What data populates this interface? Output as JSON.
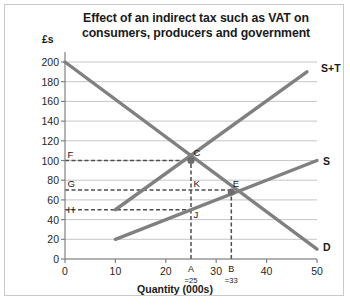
{
  "chart_data": {
    "type": "line",
    "title": "Effect of an indirect tax such as VAT on consumers, producers and government",
    "title_line1": "Effect of an indirect tax such as VAT on",
    "title_line2": "consumers, producers and government",
    "xlabel": "Quantity (000s)",
    "ylabel": "£s",
    "xlim": [
      0,
      50
    ],
    "ylim": [
      0,
      200
    ],
    "xticks": [
      0,
      10,
      20,
      30,
      40,
      50
    ],
    "yticks": [
      0,
      20,
      40,
      60,
      80,
      100,
      120,
      140,
      160,
      180,
      200
    ],
    "grid": "horizontal",
    "legend": "inline-right",
    "series": [
      {
        "name": "D",
        "label": "D",
        "color": "#808080",
        "points": [
          [
            0,
            200
          ],
          [
            50,
            10
          ]
        ]
      },
      {
        "name": "S",
        "label": "S",
        "color": "#808080",
        "points": [
          [
            10,
            20
          ],
          [
            50,
            100
          ]
        ]
      },
      {
        "name": "S+T",
        "label": "S+T",
        "color": "#808080",
        "points": [
          [
            10,
            50
          ],
          [
            48,
            190
          ]
        ]
      }
    ],
    "annotations": [
      {
        "name": "C",
        "label": "C",
        "x": 25,
        "y": 100,
        "marker": true
      },
      {
        "name": "K",
        "label": "K",
        "x": 25,
        "y": 70,
        "marker": false
      },
      {
        "name": "J",
        "label": "J",
        "x": 25,
        "y": 50,
        "marker": false
      },
      {
        "name": "E",
        "label": "E",
        "x": 33,
        "y": 68,
        "marker": true
      },
      {
        "name": "F",
        "label": "F",
        "x": 0,
        "y": 100,
        "marker": false
      },
      {
        "name": "G",
        "label": "G",
        "x": 0,
        "y": 70,
        "marker": false
      },
      {
        "name": "H",
        "label": "H",
        "x": 0,
        "y": 50,
        "marker": false
      }
    ],
    "axis_markers": [
      {
        "label": "A",
        "sub": "=25",
        "x": 25
      },
      {
        "label": "B",
        "sub": "=33",
        "x": 33
      }
    ],
    "dashed_guides": [
      {
        "from": [
          0,
          100
        ],
        "to": [
          25,
          100
        ]
      },
      {
        "from": [
          0,
          70
        ],
        "to": [
          33,
          70
        ]
      },
      {
        "from": [
          0,
          50
        ],
        "to": [
          25,
          50
        ]
      },
      {
        "from": [
          25,
          0
        ],
        "to": [
          25,
          100
        ]
      },
      {
        "from": [
          33,
          0
        ],
        "to": [
          33,
          68
        ]
      }
    ]
  },
  "labels": {
    "y_axis_title": "£s",
    "x_axis_title": "Quantity (000s)"
  }
}
